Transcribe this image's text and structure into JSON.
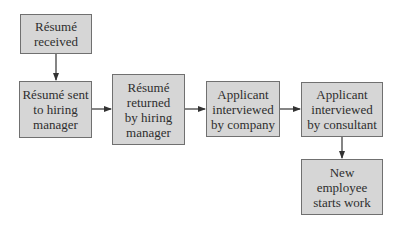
{
  "diagram": {
    "type": "flowchart",
    "colors": {
      "box_fill": "#d6d6d6",
      "box_border": "#707070",
      "text": "#2e2e2e",
      "arrow": "#333333"
    },
    "nodes": [
      {
        "id": "n1",
        "label": "Résumé received",
        "lines": [
          "Résumé",
          "received"
        ]
      },
      {
        "id": "n2",
        "label": "Résumé sent to hiring manager",
        "lines": [
          "Résumé sent",
          "to hiring",
          "manager"
        ]
      },
      {
        "id": "n3",
        "label": "Résumé returned by hiring manager",
        "lines": [
          "Résumé",
          "returned",
          "by hiring",
          "manager"
        ]
      },
      {
        "id": "n4",
        "label": "Applicant interviewed by company",
        "lines": [
          "Applicant",
          "interviewed",
          "by company"
        ]
      },
      {
        "id": "n5",
        "label": "Applicant interviewed by consultant",
        "lines": [
          "Applicant",
          "interviewed",
          "by consultant"
        ]
      },
      {
        "id": "n6",
        "label": "New employee starts work",
        "lines": [
          "New",
          "employee",
          "starts work"
        ]
      }
    ],
    "edges": [
      {
        "from": "n1",
        "to": "n2",
        "direction": "down"
      },
      {
        "from": "n2",
        "to": "n3",
        "direction": "right"
      },
      {
        "from": "n3",
        "to": "n4",
        "direction": "right"
      },
      {
        "from": "n4",
        "to": "n5",
        "direction": "right"
      },
      {
        "from": "n5",
        "to": "n6",
        "direction": "down"
      }
    ]
  }
}
